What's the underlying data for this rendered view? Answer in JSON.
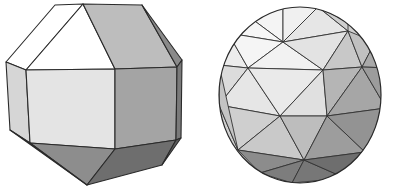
{
  "figures": [
    {
      "name": "rhombicuboctahedron",
      "faces": [
        {
          "id": "top-left-strip",
          "fill": "#ffffff",
          "points": "55,5 83,4 26,70 6,62"
        },
        {
          "id": "top-triangle",
          "fill": "#ffffff",
          "points": "83,4 115,69 26,70"
        },
        {
          "id": "top-right-square",
          "fill": "#bdbdbd",
          "points": "83,4 142,5 177,67 115,69"
        },
        {
          "id": "top-right-sliver",
          "fill": "#8a8a8a",
          "points": "142,5 182,60 177,67"
        },
        {
          "id": "left-square",
          "fill": "#d6d6d6",
          "points": "6,62 26,70 30,143 10,130"
        },
        {
          "id": "front-square",
          "fill": "#e4e4e4",
          "points": "26,70 115,69 115,149 30,143"
        },
        {
          "id": "right-square",
          "fill": "#a4a4a4",
          "points": "115,69 177,67 176,140 115,149"
        },
        {
          "id": "right-sliver",
          "fill": "#7a7a7a",
          "points": "177,67 182,60 181,138 176,140"
        },
        {
          "id": "bottom-left-triangle",
          "fill": "#8d8d8d",
          "points": "30,143 115,149 87,185"
        },
        {
          "id": "bottom-left-edge",
          "fill": "#9a9a9a",
          "points": "10,130 30,143 87,185"
        },
        {
          "id": "bottom-right-square",
          "fill": "#6e6e6e",
          "points": "115,149 176,140 162,165 87,185"
        },
        {
          "id": "bottom-right-sliver",
          "fill": "#5c5c5c",
          "points": "176,140 181,138 162,165"
        }
      ]
    },
    {
      "name": "geodesic-sphere",
      "outline": {
        "cx": 100,
        "cy": 95,
        "rx": 81,
        "ry": 88
      },
      "vertices": {
        "t1": [
          83,
          6
        ],
        "t2": [
          118,
          7
        ],
        "t3": [
          48,
          16
        ],
        "t4": [
          148,
          22
        ],
        "a1": [
          28,
          33
        ],
        "a2": [
          83,
          42
        ],
        "a3": [
          148,
          31
        ],
        "a4": [
          175,
          42
        ],
        "b1": [
          19,
          65
        ],
        "b2": [
          48,
          68
        ],
        "b3": [
          123,
          70
        ],
        "b4": [
          162,
          67
        ],
        "b5": [
          191,
          68
        ],
        "c1": [
          19,
          105
        ],
        "c2": [
          80,
          116
        ],
        "c3": [
          127,
          116
        ],
        "c4": [
          186,
          108
        ],
        "d1": [
          38,
          150
        ],
        "d2": [
          104,
          160
        ],
        "d3": [
          165,
          152
        ],
        "e1": [
          60,
          173
        ],
        "e2": [
          92,
          183
        ],
        "e3": [
          145,
          178
        ]
      },
      "triangles": [
        [
          "t3",
          "t1",
          "a2",
          "#f4f4f4"
        ],
        [
          "t1",
          "t2",
          "a2",
          "#f0f0f0"
        ],
        [
          "t2",
          "a3",
          "a2",
          "#e6e6e6"
        ],
        [
          "t2",
          "t4",
          "a3",
          "#cfcfcf"
        ],
        [
          "t3",
          "a1",
          "a2",
          "#f6f6f6"
        ],
        [
          "a1",
          "b1",
          "b2",
          "#ececec"
        ],
        [
          "a1",
          "b2",
          "a2",
          "#f5f5f5"
        ],
        [
          "a2",
          "b2",
          "b3",
          "#f2f2f2"
        ],
        [
          "a2",
          "a3",
          "b3",
          "#e3e3e3"
        ],
        [
          "a3",
          "b4",
          "b3",
          "#c8c8c8"
        ],
        [
          "a3",
          "a4",
          "b4",
          "#c0c0c0"
        ],
        [
          "a4",
          "b5",
          "b4",
          "#a9a9a9"
        ],
        [
          "b1",
          "c1",
          "b2",
          "#dcdcdc"
        ],
        [
          "b2",
          "c1",
          "c2",
          "#e6e6e6"
        ],
        [
          "b2",
          "c2",
          "b3",
          "#eaeaea"
        ],
        [
          "b3",
          "c2",
          "c3",
          "#e0e0e0"
        ],
        [
          "b3",
          "c3",
          "b4",
          "#b5b5b5"
        ],
        [
          "b4",
          "c3",
          "c4",
          "#a6a6a6"
        ],
        [
          "b4",
          "c4",
          "b5",
          "#9c9c9c"
        ],
        [
          "c1",
          "d1",
          "c2",
          "#cfcfcf"
        ],
        [
          "c2",
          "d1",
          "d2",
          "#c9c9c9"
        ],
        [
          "c2",
          "d2",
          "c3",
          "#bdbdbd"
        ],
        [
          "c3",
          "d2",
          "d3",
          "#9d9d9d"
        ],
        [
          "c3",
          "d3",
          "c4",
          "#939393"
        ],
        [
          "d1",
          "e1",
          "d2",
          "#8c8c8c"
        ],
        [
          "e1",
          "e2",
          "d2",
          "#7d7d7d"
        ],
        [
          "d2",
          "e2",
          "e3",
          "#777777"
        ],
        [
          "d2",
          "e3",
          "d3",
          "#6e6e6e"
        ],
        [
          "c1",
          "d1",
          "b1",
          "#c4c4c4"
        ]
      ]
    }
  ],
  "colors": {
    "edge": "#2a2a2a",
    "background": "#ffffff"
  }
}
